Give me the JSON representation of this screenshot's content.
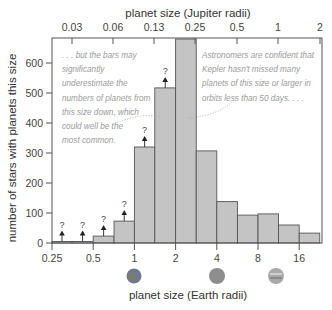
{
  "chart_data": {
    "type": "bar",
    "title": "",
    "xlabel": "planet size (Earth radii)",
    "x2label": "planet size (Jupiter radii)",
    "ylabel": "number of stars with planets this size",
    "ylim": [
      0,
      680
    ],
    "xscale": "log2",
    "xlim": [
      0.25,
      22.6
    ],
    "x_ticks": [
      "0.25",
      "0.5",
      "1",
      "2",
      "4",
      "8",
      "16"
    ],
    "x2_ticks": [
      "0.03",
      "0.06",
      "0.13",
      "0.25",
      "0.5",
      "1",
      "2"
    ],
    "y_ticks": [
      "0",
      "100",
      "200",
      "300",
      "400",
      "500",
      "600"
    ],
    "bins": [
      {
        "from": 0.25,
        "to": 0.35,
        "value": 5,
        "underestimated": true
      },
      {
        "from": 0.35,
        "to": 0.5,
        "value": 5,
        "underestimated": true
      },
      {
        "from": 0.5,
        "to": 0.71,
        "value": 23,
        "underestimated": true
      },
      {
        "from": 0.71,
        "to": 1.0,
        "value": 73,
        "underestimated": true
      },
      {
        "from": 1.0,
        "to": 1.41,
        "value": 320,
        "underestimated": true
      },
      {
        "from": 1.41,
        "to": 2.0,
        "value": 517,
        "underestimated": true
      },
      {
        "from": 2.0,
        "to": 2.83,
        "value": 680,
        "underestimated": false
      },
      {
        "from": 2.83,
        "to": 4.0,
        "value": 307,
        "underestimated": false
      },
      {
        "from": 4.0,
        "to": 5.66,
        "value": 138,
        "underestimated": false
      },
      {
        "from": 5.66,
        "to": 8.0,
        "value": 93,
        "underestimated": false
      },
      {
        "from": 8.0,
        "to": 11.3,
        "value": 97,
        "underestimated": false
      },
      {
        "from": 11.3,
        "to": 16.0,
        "value": 60,
        "underestimated": false
      },
      {
        "from": 16.0,
        "to": 22.6,
        "value": 33,
        "underestimated": false
      }
    ],
    "annotations": [
      ". . . but the bars may significantly underestimate the numbers of planets from this size down, which could well be the most common.",
      "Astronomers are confident that Kepler hasn't missed many planets of this size or larger in orbits less than 50 days. . . ."
    ],
    "marker": "?",
    "grid": false,
    "legend": "none"
  },
  "labels": {
    "xlabel": "planet size (Earth radii)",
    "x2label": "planet size (Jupiter radii)",
    "ylabel": "number of stars with planets this size",
    "annot_left": [
      ". . . but the bars may",
      "significantly",
      "underestimate the",
      "numbers of planets from",
      "this size down, which",
      "could well be the",
      "most common."
    ],
    "annot_right": [
      "Astronomers are confident that",
      "Kepler hasn't missed many",
      "planets of this size or larger in",
      "orbits less than 50 days. . . ."
    ],
    "question_mark": "?"
  },
  "colors": {
    "bar_fill": "#c4c4c4",
    "bar_stroke": "#555555",
    "axis": "#555555",
    "annotation": "#9a9a9a",
    "earth": "#6f7b8a",
    "neptune": "#8e8e8e",
    "jupiter": "#a9a9a9"
  }
}
